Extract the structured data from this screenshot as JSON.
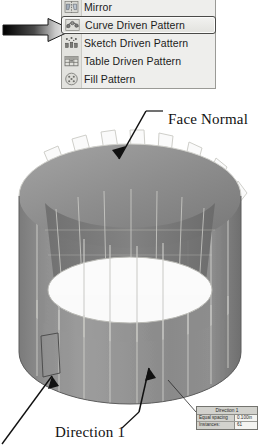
{
  "context_menu": {
    "items": [
      {
        "label": "Mirror",
        "icon": "mirror-icon",
        "selected": false
      },
      {
        "label": "Curve Driven Pattern",
        "icon": "curve-driven-pattern-icon",
        "selected": true
      },
      {
        "label": "Sketch Driven Pattern",
        "icon": "sketch-driven-pattern-icon",
        "selected": false
      },
      {
        "label": "Table Driven Pattern",
        "icon": "table-driven-pattern-icon",
        "selected": false
      },
      {
        "label": "Fill Pattern",
        "icon": "fill-pattern-icon",
        "selected": false
      }
    ]
  },
  "pointer": {
    "name": "gradient-pointer-arrow",
    "points_to": "Curve Driven Pattern",
    "gradient_from": "#000000",
    "gradient_to": "#ffffff"
  },
  "annotations": {
    "face_normal": "Face Normal",
    "direction_1": "Direction 1"
  },
  "model": {
    "name": "cylindrical-part-with-curve-driven-pattern",
    "body_color": "#8e8e8e",
    "bore_color": "#fbfbfb",
    "edge_color": "#d8d8d4"
  },
  "direction_table": {
    "header": "Direction 1",
    "rows": [
      {
        "key": "Equal spacing",
        "value": "0.100in"
      },
      {
        "key": "Instances:",
        "value": "61"
      }
    ]
  }
}
